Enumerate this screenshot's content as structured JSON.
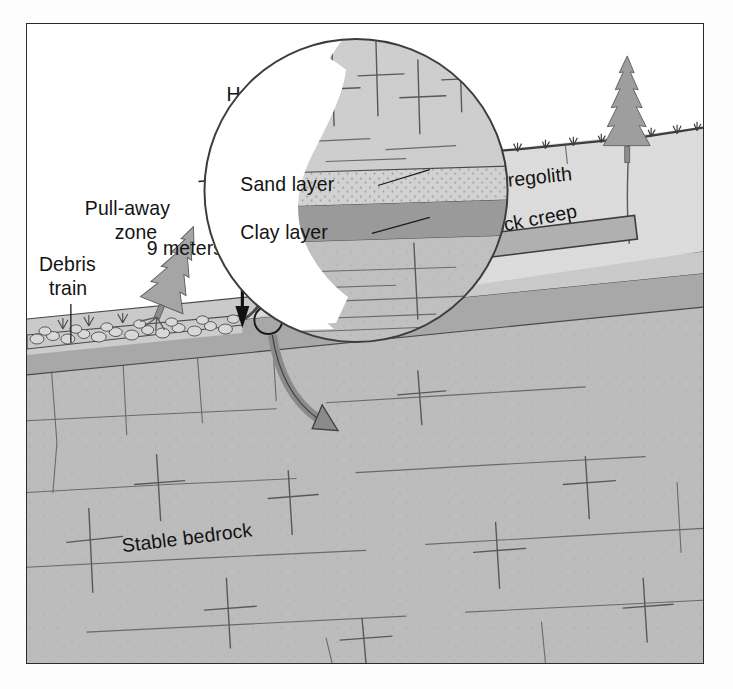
{
  "figure": {
    "type": "geologic-cross-section",
    "frame": {
      "border_color": "#2a2a2a",
      "background": "#ffffff"
    }
  },
  "labels": {
    "headwall_scarp": "Headwall\nscarp",
    "headwall_scarp_line1": "Headwall",
    "headwall_scarp_line2": "scarp",
    "pull_away_zone_line1": "Pull-away",
    "pull_away_zone_line2": "zone",
    "debris_train_line1": "Debris",
    "debris_train_line2": "train",
    "scale_measure": "9 meters",
    "unstable_regolith": "Unstable regolith",
    "bedrock_creep": "Bedrock creep",
    "stable_bedrock": "Stable bedrock",
    "sand_layer": "Sand layer",
    "clay_layer": "Clay layer"
  },
  "measurements": {
    "scarp_height_value": 9,
    "scarp_height_unit": "meters",
    "scarp_height_text": "9 meters"
  },
  "colors": {
    "regolith_fill": "#d5d5d5",
    "regolith_fill_light": "#dcdcdc",
    "bedrock_fill": "#bcbcbc",
    "bedrock_fill_deep": "#b4b4b4",
    "sand_layer_fill": "#cfcfcf",
    "clay_layer_fill": "#9a9a9a",
    "mid_band_fill": "#a6a6a6",
    "inset_background": "#ffffff",
    "tree_fill": "#9e9e9e",
    "debris_fill": "#c9c9c9",
    "arrow_fill": "#b0b0b0",
    "arrow_stroke": "#3d3d3d",
    "curved_arrow_fill": "#8a8a8a",
    "text": "#131313",
    "frame_stroke": "#2a2a2a"
  },
  "features": [
    {
      "name": "headwall-scarp",
      "description": "Steep curved break in slope at head of slump"
    },
    {
      "name": "pull-away-zone",
      "description": "Evacuated ground upslope of debris"
    },
    {
      "name": "debris-train",
      "description": "Rubble and tilted tree downslope"
    },
    {
      "name": "unstable-regolith",
      "description": "Loose surface material above bedrock"
    },
    {
      "name": "bedrock-creep",
      "description": "Slow downslope movement of bedrock, arrow points left"
    },
    {
      "name": "stable-bedrock",
      "description": "Fractured competent rock at depth"
    },
    {
      "name": "sand-layer",
      "description": "Thin stippled sand bed in magnified inset"
    },
    {
      "name": "clay-layer",
      "description": "Dark slip-plane clay bed in magnified inset"
    },
    {
      "name": "magnifier-inset",
      "description": "Circular blow-up of stratigraphy at scarp toe"
    }
  ],
  "icons": {
    "double_arrow": "vertical-double-arrow",
    "creep_arrow": "left-pointing-block-arrow",
    "magnify_link": "curved-callout-arrow",
    "trees": "conifer-tree",
    "grass": "grass-tuft"
  },
  "vegetation": {
    "tree_cluster_left_count": 3,
    "tree_single_right_count": 1,
    "fallen_tree_count": 1
  }
}
